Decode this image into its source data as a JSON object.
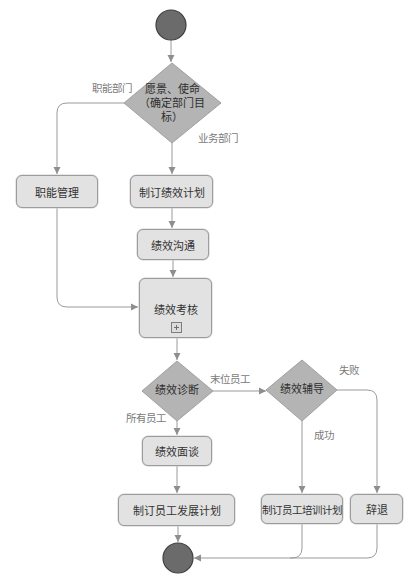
{
  "diagram": {
    "type": "flowchart",
    "colors": {
      "box_fill": "#e2e2e2",
      "box_border": "#9c9c9c",
      "diamond_fill": "#b4b4b4",
      "circle_fill": "#6b6b6b",
      "circle_border": "#3e3e3e",
      "edge": "#9a9a9a",
      "edge_label": "#7a7a7a"
    },
    "nodes": {
      "start": {
        "shape": "start-circle"
      },
      "vision": {
        "shape": "decision",
        "line1": "愿景、使命",
        "line2": "（确定部门目",
        "line3": "标）"
      },
      "func_mgmt": {
        "shape": "activity",
        "label": "职能管理"
      },
      "plan": {
        "shape": "activity",
        "label": "制订绩效计划"
      },
      "communicate": {
        "shape": "activity",
        "label": "绩效沟通"
      },
      "appraisal": {
        "shape": "activity",
        "label": "绩效考核",
        "marker": "expand-plus"
      },
      "diagnosis": {
        "shape": "decision",
        "label": "绩效诊断"
      },
      "coaching": {
        "shape": "decision",
        "label": "绩效辅导"
      },
      "interview": {
        "shape": "activity",
        "label": "绩效面谈"
      },
      "dev_plan": {
        "shape": "activity",
        "label": "制订员工发展计划"
      },
      "training_plan": {
        "shape": "activity",
        "label": "制订员工培训计划"
      },
      "dismiss": {
        "shape": "activity",
        "label": "辞退"
      },
      "end": {
        "shape": "end-circle"
      }
    },
    "edge_labels": {
      "functional_dept": "职能部门",
      "business_dept": "业务部门",
      "bottom_staff": "末位员工",
      "all_staff": "所有员工",
      "fail": "失败",
      "success": "成功"
    },
    "edges": [
      {
        "from": "start",
        "to": "vision"
      },
      {
        "from": "vision",
        "to": "func_mgmt",
        "label": "职能部门"
      },
      {
        "from": "vision",
        "to": "plan",
        "label": "业务部门"
      },
      {
        "from": "plan",
        "to": "communicate"
      },
      {
        "from": "communicate",
        "to": "appraisal"
      },
      {
        "from": "func_mgmt",
        "to": "appraisal"
      },
      {
        "from": "appraisal",
        "to": "diagnosis"
      },
      {
        "from": "diagnosis",
        "to": "interview",
        "label": "所有员工"
      },
      {
        "from": "diagnosis",
        "to": "coaching",
        "label": "末位员工"
      },
      {
        "from": "interview",
        "to": "dev_plan"
      },
      {
        "from": "coaching",
        "to": "training_plan",
        "label": "成功"
      },
      {
        "from": "coaching",
        "to": "dismiss",
        "label": "失败"
      },
      {
        "from": "dev_plan",
        "to": "end"
      },
      {
        "from": "training_plan",
        "to": "end"
      },
      {
        "from": "dismiss",
        "to": "end"
      }
    ]
  }
}
